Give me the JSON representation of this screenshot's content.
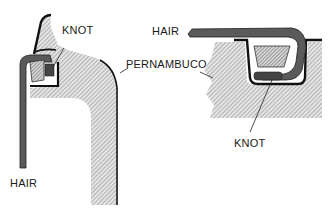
{
  "diagram": {
    "colors": {
      "ink": "#111111",
      "wood_hatch": "#8a8a8a",
      "hair": "#555555",
      "background": "#ffffff"
    },
    "left_view": {
      "labels": {
        "knot": "KNOT",
        "hair": "HAIR"
      }
    },
    "shared": {
      "labels": {
        "wood": "PERNAMBUCO"
      }
    },
    "right_view": {
      "labels": {
        "hair": "HAIR",
        "knot": "KNOT"
      }
    }
  }
}
